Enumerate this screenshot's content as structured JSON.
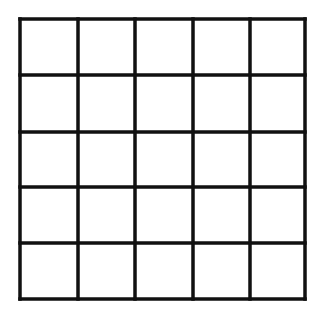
{
  "diagram": {
    "type": "grid",
    "rows": 5,
    "columns": 5,
    "background_color": "#ffffff",
    "line_color": "#111111",
    "line_width": 3.5,
    "x_lines": [
      20,
      78,
      135,
      193,
      250,
      305
    ],
    "y_lines": [
      19,
      75,
      132,
      187,
      243,
      299
    ]
  }
}
